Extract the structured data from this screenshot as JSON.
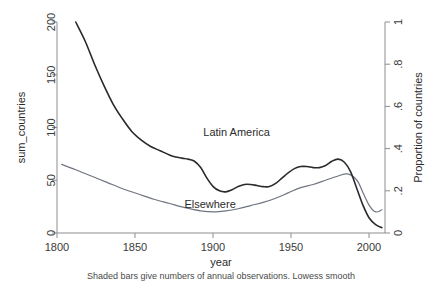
{
  "chart_data": {
    "type": "line",
    "title": "",
    "xlabel": "year",
    "ylabel": "sum_countries",
    "y2label": "Proportion of countries",
    "note": "Shaded bars give numbers of annual observations. Lowess smooth",
    "xlim": [
      1800,
      2010
    ],
    "ylim": [
      0,
      200
    ],
    "y2lim": [
      0,
      1
    ],
    "grid": false,
    "legend_position": "inline-annotations",
    "xticks": [
      1800,
      1850,
      1900,
      1950,
      2000
    ],
    "xtick_labels": [
      "1800",
      "1850",
      "1900",
      "1950",
      "2000"
    ],
    "yticks": [
      0,
      50,
      100,
      150,
      200
    ],
    "ytick_labels": [
      "0",
      "50",
      "100",
      "150",
      "200"
    ],
    "y2ticks": [
      0,
      0.2,
      0.4,
      0.6,
      0.8,
      1
    ],
    "y2tick_labels": [
      "0",
      ".2",
      ".4",
      ".6",
      ".8",
      "1"
    ],
    "annotations": [
      {
        "text": "Latin America",
        "x": 1915,
        "y": 92
      },
      {
        "text": "Elsewhere",
        "x": 1898,
        "y": 24
      }
    ],
    "series": [
      {
        "name": "Latin America",
        "color": "#2a2a2a",
        "x": [
          1812,
          1818,
          1824,
          1830,
          1836,
          1842,
          1848,
          1854,
          1860,
          1866,
          1872,
          1876,
          1880,
          1884,
          1888,
          1892,
          1896,
          1900,
          1904,
          1908,
          1912,
          1916,
          1920,
          1924,
          1928,
          1932,
          1936,
          1940,
          1944,
          1948,
          1952,
          1956,
          1960,
          1964,
          1968,
          1972,
          1976,
          1980,
          1984,
          1988,
          1992,
          1996,
          2000,
          2004,
          2008
        ],
        "values": [
          200,
          182,
          160,
          140,
          122,
          108,
          96,
          88,
          82,
          78,
          74,
          72,
          71,
          70,
          68,
          62,
          52,
          44,
          40,
          39,
          41,
          44,
          46,
          46,
          45,
          44,
          44,
          47,
          52,
          57,
          61,
          63,
          63,
          62,
          62,
          64,
          68,
          70,
          67,
          58,
          42,
          26,
          14,
          8,
          5
        ]
      },
      {
        "name": "Elsewhere",
        "color": "#6f7580",
        "x": [
          1803,
          1812,
          1822,
          1832,
          1842,
          1852,
          1862,
          1872,
          1882,
          1892,
          1900,
          1908,
          1916,
          1924,
          1932,
          1940,
          1948,
          1956,
          1964,
          1972,
          1980,
          1986,
          1992,
          1996,
          2000,
          2004,
          2008
        ],
        "values": [
          65,
          60,
          54,
          48,
          42,
          37,
          32,
          28,
          24,
          21,
          20,
          21,
          23,
          26,
          29,
          33,
          38,
          43,
          46,
          50,
          54,
          56,
          50,
          38,
          26,
          20,
          22
        ]
      }
    ]
  },
  "frame": {
    "plot_left": 57,
    "plot_right": 385,
    "plot_top": 22,
    "plot_bottom": 233
  }
}
